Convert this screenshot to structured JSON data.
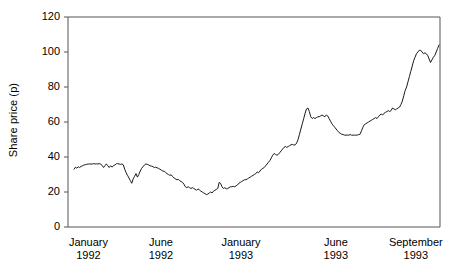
{
  "chart_data": {
    "type": "line",
    "title": "",
    "subtitle": "",
    "xlabel": "",
    "ylabel": "Share price (p)",
    "ylim": [
      0,
      120
    ],
    "yticks": [
      0,
      20,
      40,
      60,
      80,
      100,
      120
    ],
    "ytick_labels": [
      "0",
      "20",
      "40",
      "60",
      "80",
      "100",
      "120"
    ],
    "xtick_labels": [
      {
        "month": "January",
        "year": "1992"
      },
      {
        "month": "June",
        "year": "1992"
      },
      {
        "month": "January",
        "year": "1993"
      },
      {
        "month": "June",
        "year": "1993"
      },
      {
        "month": "September",
        "year": "1993"
      }
    ],
    "xtick_positions_frac": [
      0.055,
      0.25,
      0.465,
      0.72,
      0.935
    ],
    "grid": false,
    "legend": false,
    "legend_position": "none",
    "line_color": "#1a1a1a",
    "line_width": 1,
    "axis_color": "#555555",
    "background": "#ffffff",
    "series": [
      {
        "name": "Share price",
        "values": [
          33.0,
          34.2,
          33.6,
          34.4,
          34.0,
          34.6,
          35.0,
          35.4,
          35.6,
          35.8,
          36.0,
          36.0,
          36.0,
          36.0,
          36.2,
          36.0,
          36.1,
          36.0,
          36.2,
          36.0,
          35.0,
          34.0,
          35.2,
          36.0,
          35.0,
          34.0,
          35.0,
          34.2,
          35.0,
          35.4,
          36.2,
          36.2,
          36.0,
          35.8,
          36.0,
          35.5,
          33.0,
          31.0,
          29.5,
          28.0,
          26.5,
          25.0,
          27.5,
          29.0,
          30.5,
          28.5,
          30.0,
          32.0,
          33.5,
          34.5,
          35.5,
          36.0,
          35.8,
          35.5,
          35.0,
          34.8,
          34.5,
          34.0,
          34.2,
          33.8,
          33.5,
          33.0,
          32.5,
          32.0,
          31.8,
          31.2,
          30.5,
          30.0,
          29.5,
          29.8,
          28.8,
          28.0,
          27.5,
          27.0,
          27.2,
          26.5,
          26.0,
          25.5,
          24.5,
          23.0,
          22.5,
          23.0,
          22.5,
          22.0,
          22.5,
          22.0,
          21.5,
          21.0,
          21.8,
          21.2,
          20.5,
          20.0,
          19.5,
          19.0,
          18.5,
          18.8,
          19.5,
          20.0,
          19.5,
          20.5,
          21.0,
          21.5,
          22.0,
          25.5,
          25.0,
          23.0,
          22.0,
          22.5,
          21.8,
          22.0,
          22.5,
          23.0,
          23.0,
          23.2,
          23.0,
          23.5,
          24.0,
          25.0,
          25.5,
          26.0,
          26.5,
          27.0,
          27.0,
          27.5,
          28.0,
          28.5,
          29.0,
          29.5,
          30.0,
          30.5,
          31.5,
          31.0,
          32.0,
          33.0,
          33.5,
          34.0,
          35.0,
          36.0,
          37.0,
          38.0,
          39.5,
          41.0,
          42.0,
          41.5,
          41.0,
          41.5,
          42.5,
          43.5,
          44.5,
          45.5,
          46.0,
          45.5,
          46.0,
          46.5,
          47.0,
          47.2,
          46.8,
          47.0,
          48.0,
          50.0,
          53.0,
          56.0,
          59.0,
          62.0,
          65.0,
          67.5,
          68.0,
          66.0,
          63.0,
          62.0,
          62.5,
          62.0,
          62.5,
          63.0,
          63.0,
          63.5,
          64.0,
          63.5,
          63.0,
          64.0,
          63.5,
          62.0,
          60.5,
          59.0,
          58.0,
          57.0,
          56.0,
          55.0,
          54.0,
          53.5,
          53.0,
          52.8,
          52.5,
          52.5,
          52.5,
          52.5,
          52.8,
          52.5,
          52.5,
          52.5,
          52.5,
          52.5,
          52.8,
          53.0,
          55.0,
          57.0,
          58.5,
          59.0,
          59.5,
          60.0,
          60.5,
          61.0,
          61.5,
          62.0,
          62.5,
          62.0,
          63.0,
          64.0,
          64.5,
          64.0,
          65.0,
          65.5,
          66.0,
          66.5,
          66.0,
          66.5,
          68.0,
          67.5,
          67.0,
          67.5,
          68.0,
          68.5,
          70.0,
          72.0,
          75.0,
          78.0,
          80.0,
          83.0,
          86.0,
          89.0,
          92.0,
          95.0,
          97.0,
          99.0,
          100.0,
          101.0,
          101.0,
          100.0,
          99.0,
          99.5,
          99.0,
          98.0,
          96.0,
          94.0,
          95.5,
          97.0,
          98.0,
          100.0,
          102.0,
          104.0
        ]
      }
    ]
  }
}
